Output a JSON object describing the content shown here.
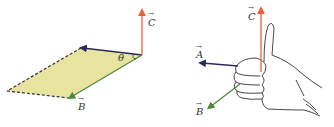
{
  "diagram": {
    "left_panel": {
      "vectors": [
        {
          "name": "C",
          "label": "C",
          "color": "#e8603c"
        },
        {
          "name": "B",
          "label": "B",
          "color": "#4a8a3a"
        },
        {
          "name": "A",
          "label": "",
          "color": "#2a2a5a"
        }
      ],
      "angle_label": "θ",
      "plane_fill": "#e8e4a0"
    },
    "right_panel": {
      "vectors": [
        {
          "name": "C",
          "label": "C",
          "color": "#e8603c"
        },
        {
          "name": "A",
          "label": "A",
          "color": "#2a2a5a"
        },
        {
          "name": "B",
          "label": "B",
          "color": "#4a8a3a"
        }
      ],
      "hand": "right-hand thumbs-up"
    },
    "arrow_accent": "→"
  }
}
